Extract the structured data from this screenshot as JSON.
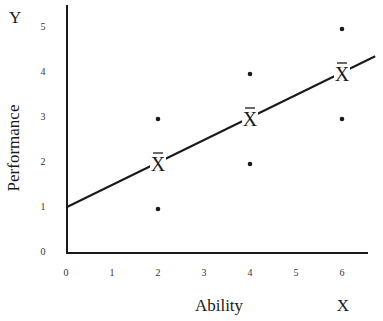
{
  "chart_data": {
    "type": "scatter",
    "title": "",
    "xlabel": "Ability",
    "ylabel": "Performance",
    "x_variable": "X",
    "y_variable": "Y",
    "xlim": [
      0,
      6.5
    ],
    "ylim": [
      0,
      5.5
    ],
    "x_ticks": [
      0,
      1,
      2,
      3,
      4,
      5,
      6
    ],
    "y_ticks": [
      0,
      1,
      2,
      3,
      4,
      5
    ],
    "grid": false,
    "legend": "none",
    "points": [
      {
        "x": 2,
        "y": 3
      },
      {
        "x": 2,
        "y": 1
      },
      {
        "x": 4,
        "y": 4
      },
      {
        "x": 4,
        "y": 2
      },
      {
        "x": 6,
        "y": 5
      },
      {
        "x": 6,
        "y": 3
      }
    ],
    "means": [
      {
        "x": 2,
        "y": 2,
        "label": "X̄"
      },
      {
        "x": 4,
        "y": 3,
        "label": "X̄"
      },
      {
        "x": 6,
        "y": 4,
        "label": "X̄"
      }
    ],
    "regression_line": {
      "intercept": 1,
      "slope": 0.5,
      "x_start": 0,
      "x_end": 6.7
    }
  },
  "colors": {
    "ink": "#1a1a1a",
    "tick": "#333333",
    "background": "#ffffff"
  }
}
